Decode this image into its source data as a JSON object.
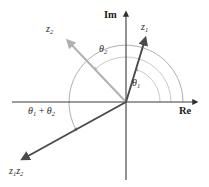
{
  "figure": {
    "type": "complex-plane-vector-diagram",
    "title": "",
    "axes": {
      "imaginary_label": "Im",
      "real_label": "Re",
      "origin": [
        126,
        102
      ],
      "im_axis_x": 126,
      "re_axis_y": 102
    },
    "vectors": [
      {
        "id": "z1",
        "label": "z",
        "label_sub": "1",
        "color": "#4a4a4a",
        "from": [
          126,
          102
        ],
        "to": [
          146,
          38
        ],
        "label_pos": [
          141,
          22
        ],
        "angle_deg": 72.6
      },
      {
        "id": "z2",
        "label": "z",
        "label_sub": "2",
        "color": "#b0b0b0",
        "from": [
          126,
          102
        ],
        "to": [
          67,
          40
        ],
        "label_pos": [
          46,
          24
        ],
        "angle_deg": 133.6
      },
      {
        "id": "z1z2",
        "label": "z",
        "label_sub": "1",
        "label2": "z",
        "label2_sub": "2",
        "color": "#4a4a4a",
        "from": [
          126,
          102
        ],
        "to": [
          22,
          160
        ],
        "label_pos": [
          9,
          166
        ],
        "angle_deg": 209.1
      }
    ],
    "arcs": [
      {
        "id": "theta1",
        "label": "θ",
        "label_sub": "1",
        "radius": 34,
        "start_deg": 0,
        "end_deg": 72.6,
        "color": "#c8b8b0",
        "label_pos": [
          132,
          78
        ]
      },
      {
        "id": "theta2",
        "label": "θ",
        "label_sub": "2",
        "radius": 45,
        "start_deg": 0,
        "end_deg": 133.6,
        "color": "#c0b4ac",
        "label_pos": [
          99,
          44
        ]
      },
      {
        "id": "theta1plus2",
        "label": "θ",
        "label_sub": "1",
        "label_op": " + ",
        "label2": "θ",
        "label2_sub": "2",
        "radius": 57,
        "start_deg": 0,
        "end_deg": 209.1,
        "color": "#9a9a9a",
        "label_pos": [
          28,
          106
        ]
      }
    ],
    "colors": {
      "axis": "#3a3a3a",
      "vector_dark": "#4a4a4a",
      "vector_light": "#b0b0b0",
      "arc_light": "#c5b7af",
      "arc_gray": "#9a9a9a",
      "text": "#2b2b2b",
      "background": "#ffffff"
    }
  }
}
